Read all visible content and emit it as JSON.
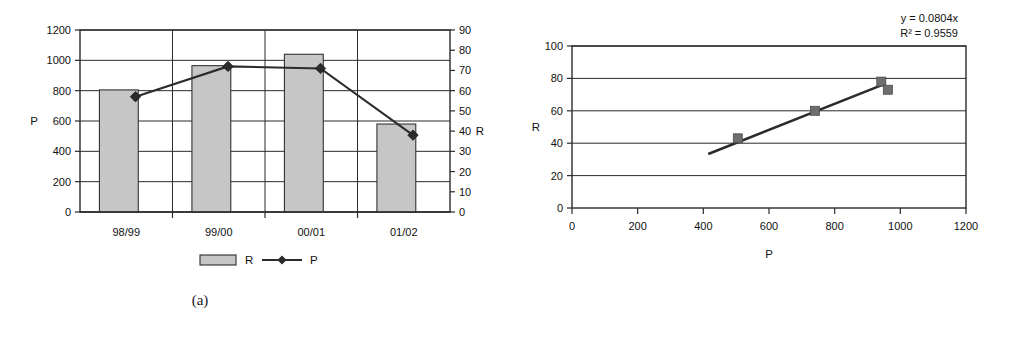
{
  "figure": {
    "caption_a": "(a)",
    "caption_b": "(b)"
  },
  "chart_data": [
    {
      "type": "bar",
      "panel": "a",
      "title": "",
      "categories": [
        "98/99",
        "99/00",
        "00/01",
        "01/02"
      ],
      "xlabel": "",
      "ylabel": "P",
      "y2label": "R",
      "ylim": [
        0,
        1200
      ],
      "y2lim": [
        0,
        90
      ],
      "yticks": [
        "0",
        "200",
        "400",
        "600",
        "800",
        "1000",
        "1200"
      ],
      "ytick_values": [
        0,
        200,
        400,
        600,
        800,
        1000,
        1200
      ],
      "y2ticks": [
        "0",
        "10",
        "20",
        "30",
        "40",
        "50",
        "60",
        "70",
        "80",
        "90"
      ],
      "y2tick_values": [
        0,
        10,
        20,
        30,
        40,
        50,
        60,
        70,
        80,
        90
      ],
      "grid": true,
      "legend_position": "bottom",
      "series": [
        {
          "name": "R",
          "kind": "bar",
          "axis": "left",
          "values": [
            805,
            965,
            1040,
            580
          ],
          "color": "#c6c6c6",
          "edge_color": "#333333"
        },
        {
          "name": "P",
          "kind": "line",
          "axis": "right",
          "marker": "diamond",
          "values": [
            57,
            72,
            71,
            38
          ],
          "color": "#2b2b2b"
        }
      ],
      "legend": [
        {
          "label": "R",
          "marker": "bar-swatch"
        },
        {
          "label": "P",
          "marker": "line-diamond"
        }
      ]
    },
    {
      "type": "scatter",
      "panel": "b",
      "title": "",
      "xlabel": "P",
      "ylabel": "R",
      "xlim": [
        0,
        1200
      ],
      "ylim": [
        0,
        100
      ],
      "xticks": [
        "0",
        "200",
        "400",
        "600",
        "800",
        "1000",
        "1200"
      ],
      "xtick_values": [
        0,
        200,
        400,
        600,
        800,
        1000,
        1200
      ],
      "yticks": [
        "0",
        "20",
        "40",
        "60",
        "80",
        "100"
      ],
      "ytick_values": [
        0,
        20,
        40,
        60,
        80,
        100
      ],
      "grid": true,
      "points": [
        {
          "x": 505,
          "y": 43
        },
        {
          "x": 740,
          "y": 60
        },
        {
          "x": 942,
          "y": 78
        },
        {
          "x": 962,
          "y": 73
        }
      ],
      "marker": "square",
      "marker_color": "#6e6e6e",
      "trendline": {
        "equation": "y = 0.0804x",
        "r2_label": "R² = 0.9559",
        "slope": 0.0804,
        "intercept": 0,
        "r2": 0.9559,
        "x_start": 415,
        "x_end": 955,
        "color": "#2b2b2b"
      },
      "annotations": [
        {
          "text": "y = 0.0804x"
        },
        {
          "text": "R² = 0.9559"
        }
      ]
    }
  ]
}
